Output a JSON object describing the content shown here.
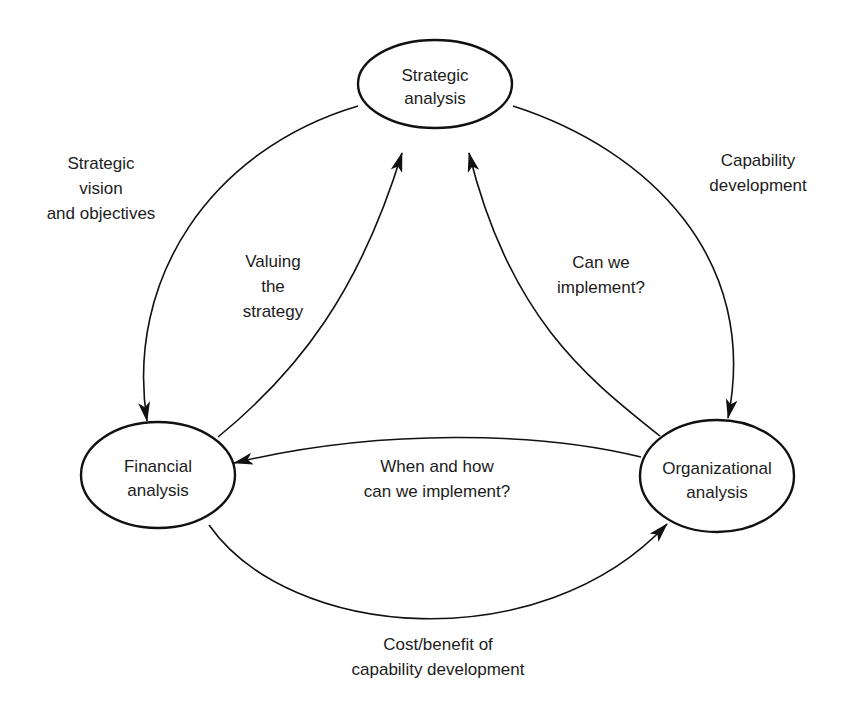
{
  "diagram": {
    "nodes": {
      "strategic": {
        "line1": "Strategic",
        "line2": "analysis"
      },
      "financial": {
        "line1": "Financial",
        "line2": "analysis"
      },
      "organizational": {
        "line1": "Organizational",
        "line2": "analysis"
      }
    },
    "edges": {
      "strategic_to_financial": {
        "line1": "Strategic",
        "line2": "vision",
        "line3": "and objectives"
      },
      "financial_to_strategic": {
        "line1": "Valuing",
        "line2": "the",
        "line3": "strategy"
      },
      "strategic_to_organizational": {
        "line1": "Capability",
        "line2": "development"
      },
      "organizational_to_strategic": {
        "line1": "Can we",
        "line2": "implement?"
      },
      "organizational_to_financial": {
        "line1": "When and how",
        "line2": "can we implement?"
      },
      "financial_to_organizational": {
        "line1": "Cost/benefit of",
        "line2": "capability development"
      }
    }
  }
}
